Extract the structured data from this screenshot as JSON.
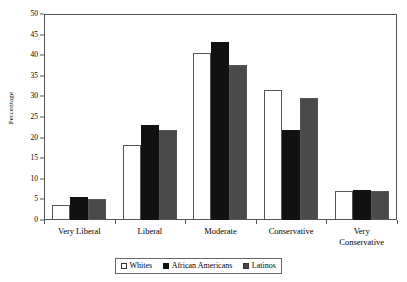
{
  "chart_data": {
    "type": "bar",
    "title": "",
    "xlabel": "",
    "ylabel": "Percentage",
    "ylim": [
      0,
      50
    ],
    "ytick_step": 5,
    "yticks": [
      0,
      5,
      10,
      15,
      20,
      25,
      30,
      35,
      40,
      45,
      50
    ],
    "grid": false,
    "legend_position": "bottom",
    "categories": [
      "Very Liberal",
      "Liberal",
      "Moderate",
      "Conservative",
      "Very\nConservative"
    ],
    "series": [
      {
        "name": "Whites",
        "pattern": "open-white",
        "values": [
          3.7,
          18.2,
          40.6,
          31.6,
          7.0
        ]
      },
      {
        "name": "African Americans",
        "pattern": "solid-black",
        "values": [
          5.6,
          23.1,
          43.2,
          21.8,
          7.4
        ]
      },
      {
        "name": "Latinos",
        "pattern": "crosshatch",
        "values": [
          5.1,
          21.8,
          37.7,
          29.6,
          7.0
        ]
      }
    ]
  },
  "colors": {
    "whites": "#ffffff",
    "african_americans": "#111111",
    "latinos_hatch": "#4a4a4a",
    "axis": "#555555",
    "text": "#000000"
  }
}
